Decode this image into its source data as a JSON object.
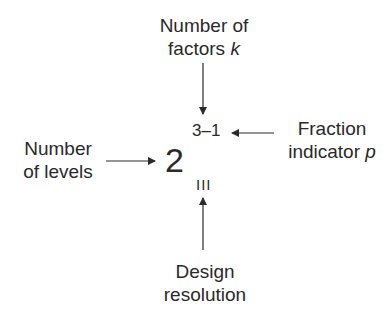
{
  "diagram": {
    "notation": {
      "base": "2",
      "exponent": "3–1",
      "subscript": "III"
    },
    "labels": {
      "top": {
        "line1": "Number of",
        "line2_text": "factors ",
        "line2_var": "k"
      },
      "right": {
        "line1": "Fraction",
        "line2_text": "indicator ",
        "line2_var": "p"
      },
      "left": {
        "line1": "Number",
        "line2": "of levels"
      },
      "bottom": {
        "line1": "Design",
        "line2": "resolution"
      }
    },
    "arrows": [
      {
        "from": "top-label",
        "to": "exponent-k",
        "direction": "down"
      },
      {
        "from": "right-label",
        "to": "exponent-p",
        "direction": "left"
      },
      {
        "from": "left-label",
        "to": "base",
        "direction": "right"
      },
      {
        "from": "bottom-label",
        "to": "subscript",
        "direction": "up"
      }
    ],
    "colors": {
      "text": "#2a2a2a",
      "arrow": "#2a2a2a",
      "background": "#ffffff"
    }
  }
}
